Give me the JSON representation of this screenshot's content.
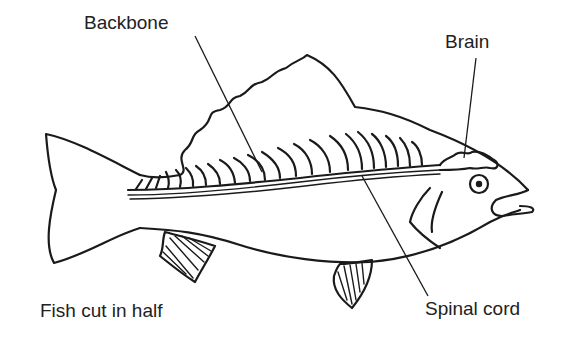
{
  "diagram": {
    "subject": "fish",
    "caption": "Fish cut in half",
    "labels": {
      "backbone": "Backbone",
      "brain": "Brain",
      "spinal_cord": "Spinal cord"
    },
    "colors": {
      "line": "#1a1a1a",
      "background": "#ffffff"
    }
  }
}
